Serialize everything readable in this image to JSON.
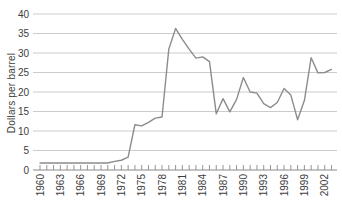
{
  "chart_data": {
    "type": "line",
    "title": "",
    "xlabel": "",
    "ylabel": "Dollars per barrel",
    "x": [
      1960,
      1961,
      1962,
      1963,
      1964,
      1965,
      1966,
      1967,
      1968,
      1969,
      1970,
      1971,
      1972,
      1973,
      1974,
      1975,
      1976,
      1977,
      1978,
      1979,
      1980,
      1981,
      1982,
      1983,
      1984,
      1985,
      1986,
      1987,
      1988,
      1989,
      1990,
      1991,
      1992,
      1993,
      1994,
      1995,
      1996,
      1997,
      1998,
      1999,
      2000,
      2001,
      2002,
      2003
    ],
    "values": [
      1.8,
      1.8,
      1.8,
      1.8,
      1.8,
      1.8,
      1.8,
      1.8,
      1.8,
      1.8,
      1.8,
      2.2,
      2.5,
      3.3,
      11.6,
      11.3,
      12.2,
      13.3,
      13.6,
      31.0,
      36.3,
      33.5,
      31.0,
      28.7,
      29.0,
      27.8,
      14.4,
      18.3,
      14.9,
      18.1,
      23.7,
      20.0,
      19.7,
      17.0,
      16.0,
      17.3,
      20.9,
      19.2,
      12.9,
      17.8,
      28.8,
      24.9,
      25.0,
      25.8
    ],
    "ylim": [
      0,
      40
    ],
    "yticks": [
      0,
      5,
      10,
      15,
      20,
      25,
      30,
      35,
      40
    ],
    "xtick_labels": [
      "1960",
      "1963",
      "1966",
      "1969",
      "1972",
      "1975",
      "1978",
      "1981",
      "1984",
      "1987",
      "1990",
      "1993",
      "1996",
      "1999",
      "2002"
    ],
    "grid": "horizontal",
    "legend": "none",
    "line_color": "#8c8c8c",
    "grid_color": "#cccccc",
    "axis_color": "#8a8a8a",
    "text_color": "#3d3d3d"
  }
}
